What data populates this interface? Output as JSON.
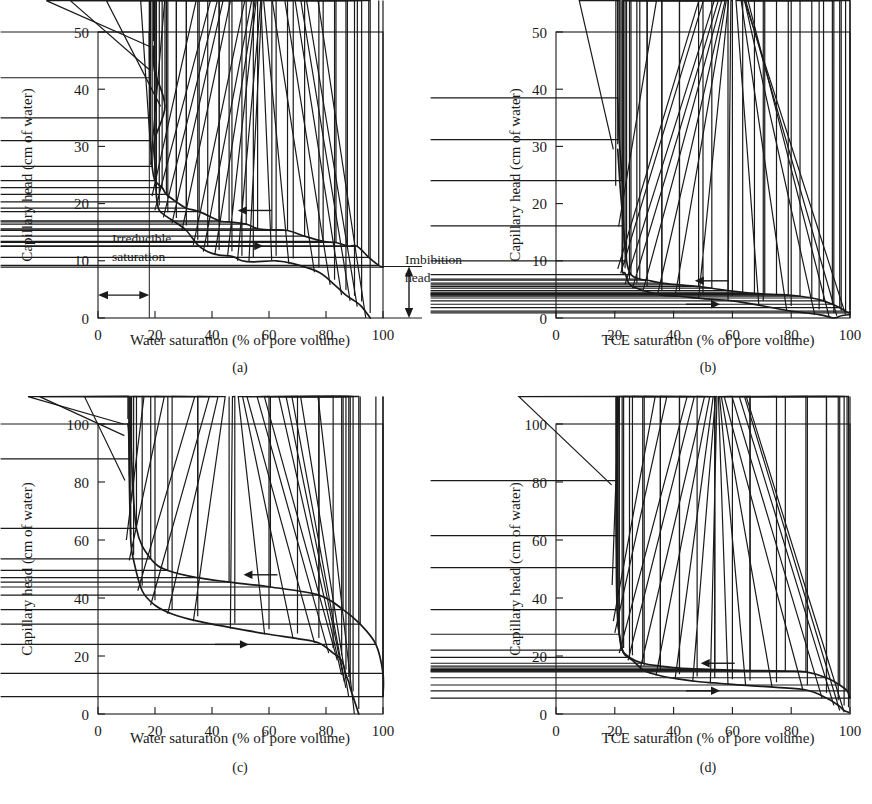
{
  "figure": {
    "kind": "four-panel-capillary-pressure-figure",
    "axis_titles": {
      "y": "Capillary head    (cm of water)",
      "x_water": "Water saturation (% of pore volume)",
      "x_tce": "TCE saturation (% of pore volume)"
    },
    "panel_labels": [
      "(a)",
      "(b)",
      "(c)",
      "(d)"
    ],
    "annotations": {
      "irreducible_saturation": "Irreducible\nsaturation",
      "irreducible_saturation_line1": "Irreducible",
      "irreducible_saturation_line2": "saturation",
      "imbibition_head_line1": "Imbibition",
      "imbibition_head_line2": "head"
    },
    "colors": {
      "ink": "#1a1a1a",
      "background": "#ffffff"
    },
    "direction_arrows": {
      "drainage": "left-arrow",
      "imbibition": "right-arrow"
    }
  },
  "chart_data": [
    {
      "id": "a",
      "type": "line",
      "title": "(a)",
      "xlabel": "Water saturation (% of pore volume)",
      "ylabel": "Capillary head    (cm of water)",
      "xlim": [
        0,
        100
      ],
      "ylim": [
        0,
        50
      ],
      "xticks": [
        0,
        20,
        40,
        60,
        80,
        100
      ],
      "yticks": [
        0,
        10,
        20,
        30,
        40,
        50
      ],
      "grid": false,
      "legend": "none",
      "annotations": [
        {
          "text": "Irreducible saturation",
          "x_range": [
            0,
            18
          ],
          "y": 4
        },
        {
          "text": "Imbibition head",
          "x": 100,
          "y_range": [
            0,
            9
          ]
        },
        {
          "text": "left-arrow",
          "x": 55,
          "y": 18.8
        },
        {
          "text": "right-arrow",
          "x": 52,
          "y": 12.6
        }
      ],
      "vertical_marker_x": 18,
      "series": [
        {
          "name": "drainage",
          "marker": "plus",
          "direction": "left-arrow",
          "points": [
            [
              18.0,
              50.0
            ],
            [
              18.1,
              42.0
            ],
            [
              18.2,
              35.0
            ],
            [
              18.4,
              31.0
            ],
            [
              19.0,
              26.5
            ],
            [
              20.0,
              24.0
            ],
            [
              22.5,
              22.8
            ],
            [
              24.0,
              21.6
            ],
            [
              27.5,
              20.3
            ],
            [
              31.0,
              19.2
            ],
            [
              35.5,
              18.6
            ],
            [
              42.5,
              17.0
            ],
            [
              46.0,
              16.8
            ],
            [
              52.0,
              16.4
            ],
            [
              56.0,
              15.6
            ],
            [
              61.0,
              15.4
            ],
            [
              66.5,
              15.3
            ],
            [
              72.5,
              14.3
            ],
            [
              79.0,
              13.4
            ],
            [
              83.5,
              13.2
            ],
            [
              87.5,
              12.6
            ],
            [
              91.0,
              12.5
            ],
            [
              95.0,
              10.6
            ],
            [
              98.5,
              9.2
            ],
            [
              100.0,
              8.9
            ]
          ]
        },
        {
          "name": "imbibition",
          "marker": "triangle",
          "direction": "right-arrow",
          "points": [
            [
              19.5,
              47.5
            ],
            [
              19.8,
              43.3
            ],
            [
              23.5,
              37.0
            ],
            [
              19.8,
              31.0
            ],
            [
              20.0,
              26.8
            ],
            [
              20.5,
              21.3
            ],
            [
              21.5,
              18.8
            ],
            [
              24.5,
              17.6
            ],
            [
              27.5,
              16.6
            ],
            [
              31.0,
              15.3
            ],
            [
              35.0,
              12.8
            ],
            [
              38.5,
              11.6
            ],
            [
              42.5,
              11.0
            ],
            [
              47.0,
              10.8
            ],
            [
              50.5,
              10.0
            ],
            [
              54.5,
              9.8
            ],
            [
              62.5,
              10.0
            ],
            [
              68.5,
              9.5
            ],
            [
              77.5,
              8.0
            ],
            [
              83.0,
              5.8
            ],
            [
              87.0,
              4.0
            ],
            [
              90.0,
              3.0
            ],
            [
              92.5,
              2.0
            ],
            [
              95.5,
              0.0
            ]
          ]
        }
      ]
    },
    {
      "id": "b",
      "type": "line",
      "title": "(b)",
      "xlabel": "TCE saturation (% of pore volume)",
      "ylabel": "Capillary head    (cm of water)",
      "xlim": [
        0,
        100
      ],
      "ylim": [
        0,
        50
      ],
      "xticks": [
        0,
        20,
        40,
        60,
        80,
        100
      ],
      "yticks": [
        0,
        10,
        20,
        30,
        40,
        50
      ],
      "grid": false,
      "legend": "none",
      "annotations": [
        {
          "text": "left-arrow",
          "x": 53,
          "y": 6.5
        },
        {
          "text": "right-arrow",
          "x": 50,
          "y": 2.4
        }
      ],
      "series": [
        {
          "name": "drainage",
          "marker": "plus",
          "direction": "left-arrow",
          "points": [
            [
              21.0,
              38.5
            ],
            [
              21.5,
              31.2
            ],
            [
              22.5,
              24.0
            ],
            [
              23.0,
              16.1
            ],
            [
              24.0,
              10.0
            ],
            [
              25.5,
              7.6
            ],
            [
              28.5,
              6.8
            ],
            [
              31.0,
              6.6
            ],
            [
              36.0,
              6.1
            ],
            [
              42.0,
              5.8
            ],
            [
              48.5,
              5.5
            ],
            [
              53.0,
              5.2
            ],
            [
              58.5,
              4.8
            ],
            [
              63.5,
              4.5
            ],
            [
              67.5,
              4.3
            ],
            [
              71.0,
              4.2
            ],
            [
              75.0,
              4.1
            ],
            [
              79.0,
              4.0
            ],
            [
              83.0,
              3.8
            ],
            [
              87.0,
              3.5
            ],
            [
              91.0,
              3.0
            ],
            [
              94.0,
              2.4
            ],
            [
              96.5,
              1.8
            ],
            [
              98.5,
              1.2
            ],
            [
              100.0,
              0.9
            ]
          ]
        },
        {
          "name": "imbibition",
          "marker": "triangle",
          "direction": "right-arrow",
          "points": [
            [
              21.0,
              29.5
            ],
            [
              21.8,
              23.1
            ],
            [
              22.8,
              16.0
            ],
            [
              22.5,
              8.6
            ],
            [
              23.5,
              7.8
            ],
            [
              25.0,
              5.9
            ],
            [
              27.5,
              5.2
            ],
            [
              31.0,
              4.6
            ],
            [
              36.0,
              4.0
            ],
            [
              42.0,
              3.8
            ],
            [
              50.0,
              3.4
            ],
            [
              60.0,
              3.0
            ],
            [
              70.5,
              2.1
            ],
            [
              80.0,
              1.2
            ],
            [
              89.5,
              0.6
            ],
            [
              94.5,
              0.0
            ],
            [
              97.0,
              0.4
            ],
            [
              100.0,
              0.6
            ]
          ]
        }
      ]
    },
    {
      "id": "c",
      "type": "line",
      "title": "(c)",
      "xlabel": "Water saturation (% of pore volume)",
      "ylabel": "Capillary head    (cm of water)",
      "xlim": [
        0,
        100
      ],
      "ylim": [
        0,
        100
      ],
      "xticks": [
        0,
        20,
        40,
        60,
        80,
        100
      ],
      "yticks": [
        0,
        20,
        40,
        60,
        80,
        100
      ],
      "grid": false,
      "legend": "none",
      "annotations": [
        {
          "text": "left-arrow",
          "x": 57,
          "y": 48
        },
        {
          "text": "right-arrow",
          "x": 47,
          "y": 24
        }
      ],
      "series": [
        {
          "name": "drainage",
          "marker": "plus",
          "direction": "left-arrow",
          "points": [
            [
              11.5,
              100.0
            ],
            [
              11.8,
              88.0
            ],
            [
              13.5,
              64.0
            ],
            [
              18.5,
              53.5
            ],
            [
              24.5,
              49.5
            ],
            [
              35.0,
              47.0
            ],
            [
              46.0,
              45.5
            ],
            [
              60.5,
              43.8
            ],
            [
              77.5,
              41.0
            ],
            [
              86.0,
              36.0
            ],
            [
              92.0,
              31.0
            ],
            [
              97.5,
              24.0
            ],
            [
              100.0,
              14.0
            ],
            [
              100.0,
              6.0
            ]
          ]
        },
        {
          "name": "imbibition",
          "marker": "triangle",
          "direction": "right-arrow",
          "points": [
            [
              10.5,
              100.0
            ],
            [
              10.8,
              96.0
            ],
            [
              11.0,
              80.5
            ],
            [
              11.5,
              60.0
            ],
            [
              12.5,
              53.0
            ],
            [
              15.5,
              42.5
            ],
            [
              20.0,
              37.5
            ],
            [
              26.0,
              34.5
            ],
            [
              35.0,
              32.0
            ],
            [
              48.0,
              29.5
            ],
            [
              60.0,
              27.5
            ],
            [
              70.0,
              26.0
            ],
            [
              77.5,
              24.5
            ],
            [
              82.5,
              21.0
            ],
            [
              85.5,
              18.5
            ],
            [
              87.0,
              13.5
            ],
            [
              88.0,
              11.0
            ],
            [
              88.5,
              9.0
            ],
            [
              89.5,
              6.0
            ],
            [
              91.5,
              0.0
            ]
          ]
        }
      ]
    },
    {
      "id": "d",
      "type": "line",
      "title": "(d)",
      "xlabel": "TCE saturation (% of pore volume)",
      "ylabel": "Capillary head    (cm of water)",
      "xlim": [
        0,
        100
      ],
      "ylim": [
        0,
        100
      ],
      "xticks": [
        0,
        20,
        40,
        60,
        80,
        100
      ],
      "yticks": [
        0,
        20,
        40,
        60,
        80,
        100
      ],
      "grid": false,
      "legend": "none",
      "annotations": [
        {
          "text": "left-arrow",
          "x": 55,
          "y": 17.5
        },
        {
          "text": "right-arrow",
          "x": 50,
          "y": 8.0
        }
      ],
      "series": [
        {
          "name": "drainage",
          "marker": "plus",
          "direction": "left-arrow",
          "points": [
            [
              20.5,
              80.5
            ],
            [
              20.6,
              61.5
            ],
            [
              20.8,
              50.5
            ],
            [
              21.0,
              36.0
            ],
            [
              21.5,
              27.5
            ],
            [
              22.5,
              22.0
            ],
            [
              25.0,
              19.5
            ],
            [
              29.5,
              17.5
            ],
            [
              35.5,
              16.5
            ],
            [
              42.0,
              15.8
            ],
            [
              54.0,
              15.3
            ],
            [
              66.0,
              15.0
            ],
            [
              78.0,
              14.8
            ],
            [
              85.0,
              14.5
            ],
            [
              92.0,
              12.5
            ],
            [
              96.5,
              10.0
            ],
            [
              99.0,
              8.0
            ],
            [
              100.0,
              5.5
            ]
          ]
        },
        {
          "name": "imbibition",
          "marker": "triangle",
          "direction": "right-arrow",
          "points": [
            [
              20.4,
              79.0
            ],
            [
              20.6,
              44.5
            ],
            [
              21.0,
              32.0
            ],
            [
              21.5,
              28.0
            ],
            [
              23.0,
              21.0
            ],
            [
              26.0,
              18.5
            ],
            [
              30.0,
              15.0
            ],
            [
              35.5,
              13.2
            ],
            [
              42.0,
              12.0
            ],
            [
              48.0,
              11.2
            ],
            [
              54.0,
              10.7
            ],
            [
              60.0,
              10.2
            ],
            [
              66.0,
              9.8
            ],
            [
              75.0,
              9.2
            ],
            [
              85.5,
              8.2
            ],
            [
              92.0,
              5.5
            ],
            [
              96.0,
              3.0
            ],
            [
              98.0,
              1.2
            ],
            [
              99.5,
              0.6
            ]
          ]
        }
      ]
    }
  ]
}
